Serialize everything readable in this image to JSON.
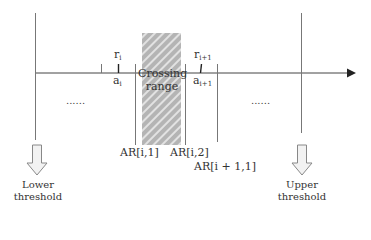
{
  "diagram": {
    "colors": {
      "line": "#555555",
      "axis": "#444444",
      "hatch_bg": "#b4b4b4",
      "hatch_stripe": "#e4e4e4",
      "arrow_fill": "#f2f2f2",
      "arrow_stroke": "#888888",
      "text": "#333333"
    },
    "axis": {
      "arrow": "right"
    },
    "crossing_range": {
      "line1": "Crossing",
      "line2": "range"
    },
    "ticks": {
      "r_i": {
        "base": "r",
        "sub": "i"
      },
      "a_i": {
        "base": "a",
        "sub": "i"
      },
      "r_i1": {
        "base": "r",
        "sub": "i+1"
      },
      "a_i1": {
        "base": "a",
        "sub": "i+1"
      }
    },
    "boundaries": {
      "ar_i_1": "AR[i,1]",
      "ar_i_2": "AR[i,2]",
      "ar_i1_1": "AR[i + 1,1]"
    },
    "ellipsis_left": "......",
    "ellipsis_right": "......",
    "thresholds": {
      "lower": {
        "line1": "Lower",
        "line2": "threshold"
      },
      "upper": {
        "line1": "Upper",
        "line2": "threshold"
      }
    }
  }
}
